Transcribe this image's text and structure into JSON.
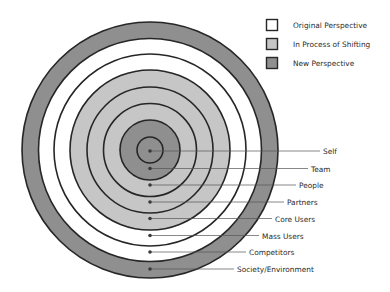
{
  "colors": {
    "new": "#8f8f8f",
    "shifting": "#c6c6c6",
    "original": "#ffffff",
    "stroke": "#262626",
    "text": "#2a2a2a"
  },
  "legend": [
    {
      "label": "Original Perspective",
      "state": "original"
    },
    {
      "label": "In Process of Shifting",
      "state": "shifting"
    },
    {
      "label": "New Perspective",
      "state": "new"
    }
  ],
  "rings": [
    {
      "label": "Self",
      "state": "new"
    },
    {
      "label": "Team",
      "state": "new"
    },
    {
      "label": "People",
      "state": "shifting"
    },
    {
      "label": "Partners",
      "state": "shifting"
    },
    {
      "label": "Core Users",
      "state": "shifting"
    },
    {
      "label": "Mass Users",
      "state": "original"
    },
    {
      "label": "Competitors",
      "state": "original"
    },
    {
      "label": "Society/Environment",
      "state": "new"
    }
  ]
}
